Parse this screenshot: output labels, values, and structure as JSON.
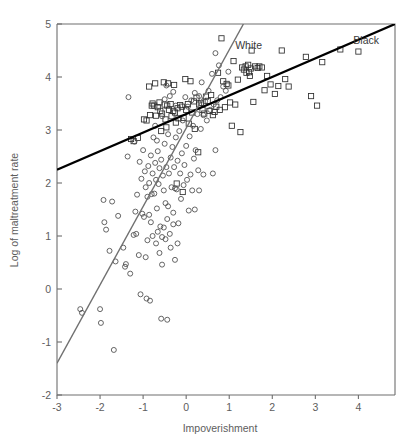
{
  "chart_data": {
    "type": "scatter",
    "title": "",
    "xlabel": "Impoverishment",
    "ylabel": "Log of maltreatment rate",
    "xlim": [
      -3,
      4.85
    ],
    "ylim": [
      -2,
      5
    ],
    "xticks": [
      -3,
      -2,
      -1,
      0,
      1,
      2,
      3,
      4
    ],
    "xticklabels": [
      "-3",
      "-2",
      "-1",
      "0",
      "1",
      "2",
      "3",
      "4"
    ],
    "yticks": [
      -2,
      -1,
      0,
      1,
      2,
      3,
      4,
      5
    ],
    "yticklabels": [
      "-2",
      "-1",
      "0",
      "1",
      "2",
      "3",
      "4",
      "5"
    ],
    "grid": false,
    "legend_position": "inline-annotation",
    "annotations": [
      {
        "text": "White",
        "x": 1.45,
        "y": 4.52,
        "name": "white-series-label"
      },
      {
        "text": "Black",
        "x": 4.18,
        "y": 4.63,
        "name": "black-series-label"
      }
    ],
    "series": [
      {
        "name": "Black",
        "marker": "square",
        "color": "#2e2e2e",
        "fit_line": {
          "name": "Black",
          "color": "#000000",
          "x": [
            -3,
            4.85
          ],
          "y": [
            2.25,
            5.0
          ]
        },
        "points": [
          [
            -1.28,
            2.83
          ],
          [
            -1.22,
            2.79
          ],
          [
            -1.12,
            2.85
          ],
          [
            -0.98,
            3.2
          ],
          [
            -0.92,
            3.18
          ],
          [
            -0.86,
            3.82
          ],
          [
            -0.84,
            3.28
          ],
          [
            -0.8,
            3.46
          ],
          [
            -0.78,
            3.5
          ],
          [
            -0.74,
            3.46
          ],
          [
            -0.72,
            3.88
          ],
          [
            -0.7,
            3.27
          ],
          [
            -0.66,
            3.43
          ],
          [
            -0.62,
            3.52
          ],
          [
            -0.6,
            3.36
          ],
          [
            -0.58,
            2.98
          ],
          [
            -0.56,
            3.31
          ],
          [
            -0.52,
            3.9
          ],
          [
            -0.5,
            3.48
          ],
          [
            -0.48,
            3.2
          ],
          [
            -0.46,
            3.05
          ],
          [
            -0.44,
            3.46
          ],
          [
            -0.42,
            3.88
          ],
          [
            -0.4,
            3.38
          ],
          [
            -0.36,
            3.49
          ],
          [
            -0.34,
            3.26
          ],
          [
            -0.3,
            3.36
          ],
          [
            -0.28,
            3.85
          ],
          [
            -0.26,
            3.33
          ],
          [
            -0.24,
            3.14
          ],
          [
            -0.22,
            1.99
          ],
          [
            -0.2,
            3.41
          ],
          [
            -0.18,
            3.22
          ],
          [
            -0.14,
            3.47
          ],
          [
            -0.1,
            3.44
          ],
          [
            -0.08,
            1.83
          ],
          [
            -0.06,
            3.23
          ],
          [
            -0.02,
            3.96
          ],
          [
            0.0,
            3.38
          ],
          [
            0.04,
            3.49
          ],
          [
            0.06,
            3.12
          ],
          [
            0.1,
            3.92
          ],
          [
            0.14,
            3.33
          ],
          [
            0.18,
            3.54
          ],
          [
            0.2,
            3.02
          ],
          [
            0.24,
            3.61
          ],
          [
            0.28,
            2.58
          ],
          [
            0.3,
            3.48
          ],
          [
            0.34,
            3.51
          ],
          [
            0.38,
            3.38
          ],
          [
            0.42,
            3.31
          ],
          [
            0.46,
            3.63
          ],
          [
            0.5,
            3.55
          ],
          [
            0.54,
            3.36
          ],
          [
            0.58,
            3.66
          ],
          [
            0.62,
            3.28
          ],
          [
            0.66,
            3.34
          ],
          [
            0.7,
            3.44
          ],
          [
            0.74,
            4.08
          ],
          [
            0.78,
            3.38
          ],
          [
            0.82,
            4.73
          ],
          [
            0.86,
            3.92
          ],
          [
            0.9,
            3.43
          ],
          [
            0.94,
            3.87
          ],
          [
            0.98,
            3.84
          ],
          [
            1.02,
            3.52
          ],
          [
            1.06,
            3.08
          ],
          [
            1.1,
            4.3
          ],
          [
            1.14,
            3.48
          ],
          [
            1.2,
            3.95
          ],
          [
            1.26,
            2.96
          ],
          [
            1.3,
            4.18
          ],
          [
            1.34,
            4.14
          ],
          [
            1.38,
            4.2
          ],
          [
            1.4,
            4.08
          ],
          [
            1.44,
            4.23
          ],
          [
            1.46,
            4.09
          ],
          [
            1.48,
            4.02
          ],
          [
            1.5,
            4.16
          ],
          [
            1.52,
            4.5
          ],
          [
            1.56,
            3.53
          ],
          [
            1.6,
            4.2
          ],
          [
            1.66,
            4.17
          ],
          [
            1.7,
            4.2
          ],
          [
            1.76,
            4.18
          ],
          [
            1.82,
            3.75
          ],
          [
            1.88,
            4.02
          ],
          [
            1.96,
            3.86
          ],
          [
            2.06,
            3.68
          ],
          [
            2.14,
            3.83
          ],
          [
            2.22,
            4.5
          ],
          [
            2.3,
            3.96
          ],
          [
            2.38,
            3.82
          ],
          [
            2.78,
            4.38
          ],
          [
            2.9,
            3.64
          ],
          [
            3.04,
            3.46
          ],
          [
            3.16,
            4.28
          ],
          [
            3.58,
            4.52
          ],
          [
            4.0,
            4.48
          ]
        ]
      },
      {
        "name": "White",
        "marker": "circle",
        "color": "#4a4a4a",
        "fit_line": {
          "name": "White",
          "color": "#707070",
          "x": [
            -3,
            1.33
          ],
          "y": [
            -1.4,
            5.0
          ]
        },
        "points": [
          [
            -2.46,
            -0.38
          ],
          [
            -2.42,
            -0.45
          ],
          [
            -2.0,
            -0.38
          ],
          [
            -1.98,
            -0.64
          ],
          [
            -1.92,
            1.68
          ],
          [
            -1.9,
            1.26
          ],
          [
            -1.86,
            1.12
          ],
          [
            -1.78,
            0.72
          ],
          [
            -1.72,
            1.65
          ],
          [
            -1.68,
            -1.15
          ],
          [
            -1.64,
            0.52
          ],
          [
            -1.58,
            1.38
          ],
          [
            -1.46,
            0.78
          ],
          [
            -1.42,
            0.42
          ],
          [
            -1.4,
            0.47
          ],
          [
            -1.36,
            2.5
          ],
          [
            -1.3,
            0.29
          ],
          [
            -1.22,
            1.02
          ],
          [
            -1.2,
            2.78
          ],
          [
            -1.16,
            1.04
          ],
          [
            -1.1,
            0.64
          ],
          [
            -1.06,
            -0.1
          ],
          [
            -1.02,
            1.42
          ],
          [
            -1.0,
            2.62
          ],
          [
            -0.98,
            1.36
          ],
          [
            -0.96,
            2.22
          ],
          [
            -0.94,
            0.6
          ],
          [
            -0.92,
            -0.18
          ],
          [
            -0.9,
            1.74
          ],
          [
            -0.88,
            2.32
          ],
          [
            -0.86,
            2.0
          ],
          [
            -0.84,
            -0.22
          ],
          [
            -0.82,
            2.52
          ],
          [
            -0.8,
            1.79
          ],
          [
            -0.78,
            2.18
          ],
          [
            -0.76,
            2.86
          ],
          [
            -0.74,
            1.8
          ],
          [
            -0.72,
            2.38
          ],
          [
            -0.7,
            2.06
          ],
          [
            -0.68,
            1.52
          ],
          [
            -0.66,
            2.6
          ],
          [
            -0.64,
            1.98
          ],
          [
            -0.62,
            2.28
          ],
          [
            -0.6,
            1.18
          ],
          [
            -0.58,
            2.44
          ],
          [
            -0.56,
            0.98
          ],
          [
            -0.54,
            2.14
          ],
          [
            -0.52,
            1.86
          ],
          [
            -0.5,
            2.74
          ],
          [
            -0.48,
            1.62
          ],
          [
            -0.46,
            2.3
          ],
          [
            -0.44,
            1.32
          ],
          [
            -0.42,
            2.92
          ],
          [
            -0.4,
            2.18
          ],
          [
            -0.38,
            1.04
          ],
          [
            -0.36,
            2.48
          ],
          [
            -0.34,
            1.92
          ],
          [
            -0.32,
            2.68
          ],
          [
            -0.3,
            1.44
          ],
          [
            -0.28,
            2.3
          ],
          [
            -0.26,
            0.55
          ],
          [
            -0.24,
            2.86
          ],
          [
            -0.22,
            1.88
          ],
          [
            -0.2,
            2.42
          ],
          [
            -0.18,
            1.24
          ],
          [
            -0.16,
            2.98
          ],
          [
            -0.14,
            2.18
          ],
          [
            -0.12,
            1.7
          ],
          [
            -0.1,
            2.56
          ],
          [
            -0.08,
            3.18
          ],
          [
            -0.06,
            1.96
          ],
          [
            -0.04,
            2.34
          ],
          [
            -0.02,
            3.62
          ],
          [
            0.0,
            2.7
          ],
          [
            0.02,
            2.06
          ],
          [
            0.04,
            3.44
          ],
          [
            0.06,
            1.48
          ],
          [
            0.08,
            2.88
          ],
          [
            0.1,
            2.16
          ],
          [
            0.12,
            3.56
          ],
          [
            0.14,
            1.86
          ],
          [
            0.16,
            3.08
          ],
          [
            0.18,
            2.46
          ],
          [
            0.2,
            3.7
          ],
          [
            0.22,
            2.62
          ],
          [
            0.26,
            3.3
          ],
          [
            0.28,
            2.24
          ],
          [
            0.3,
            3.64
          ],
          [
            0.34,
            3.02
          ],
          [
            0.36,
            3.9
          ],
          [
            0.4,
            3.28
          ],
          [
            0.44,
            3.54
          ],
          [
            0.48,
            3.18
          ],
          [
            0.52,
            3.74
          ],
          [
            0.56,
            3.38
          ],
          [
            0.6,
            4.06
          ],
          [
            0.64,
            3.48
          ],
          [
            0.68,
            4.45
          ],
          [
            0.72,
            3.56
          ],
          [
            0.76,
            4.22
          ],
          [
            0.8,
            3.62
          ],
          [
            0.86,
            3.82
          ],
          [
            0.92,
            3.74
          ],
          [
            0.98,
            4.1
          ],
          [
            -0.56,
            0.46
          ],
          [
            -0.58,
            -0.56
          ],
          [
            -0.44,
            -0.58
          ],
          [
            -0.48,
            0.94
          ],
          [
            -0.66,
            1.08
          ],
          [
            -0.7,
            0.86
          ],
          [
            -0.86,
            1.4
          ],
          [
            -0.9,
            0.92
          ],
          [
            -1.14,
            1.78
          ],
          [
            -1.18,
            1.46
          ],
          [
            -0.62,
            0.68
          ],
          [
            -0.52,
            1.16
          ],
          [
            -0.36,
            0.78
          ],
          [
            -0.3,
            1.22
          ],
          [
            -0.26,
            1.9
          ],
          [
            -0.2,
            0.86
          ],
          [
            -0.42,
            1.56
          ],
          [
            -0.78,
            1.0
          ],
          [
            -0.82,
            1.26
          ],
          [
            -0.94,
            1.92
          ],
          [
            -1.04,
            2.08
          ],
          [
            -1.08,
            2.4
          ],
          [
            -0.68,
            2.8
          ],
          [
            -0.72,
            3.08
          ],
          [
            -0.56,
            3.26
          ],
          [
            -0.5,
            3.58
          ],
          [
            -0.46,
            3.84
          ],
          [
            -0.38,
            3.64
          ],
          [
            -0.3,
            3.72
          ],
          [
            -0.24,
            3.46
          ],
          [
            -1.34,
            3.62
          ],
          [
            0.4,
            2.16
          ],
          [
            0.62,
            2.18
          ],
          [
            0.68,
            2.62
          ],
          [
            0.2,
            1.5
          ],
          [
            0.3,
            1.86
          ]
        ]
      }
    ]
  },
  "axes_geometry": {
    "plot_left_px": 57,
    "plot_right_px": 395,
    "plot_top_px": 24,
    "plot_bottom_px": 395
  }
}
